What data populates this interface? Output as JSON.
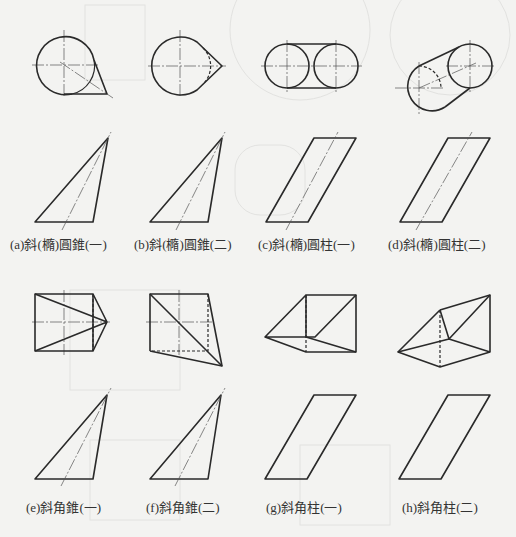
{
  "figure": {
    "panels": [
      {
        "id": "a",
        "caption": "(a)斜(橢)圓錐(一)"
      },
      {
        "id": "b",
        "caption": "(b)斜(橢)圓錐(二)"
      },
      {
        "id": "c",
        "caption": "(c)斜(橢)圓柱(一)"
      },
      {
        "id": "d",
        "caption": "(d)斜(橢)圓柱(二)"
      },
      {
        "id": "e",
        "caption": "(e)斜角錐(一)"
      },
      {
        "id": "f",
        "caption": "(f)斜角錐(二)"
      },
      {
        "id": "g",
        "caption": "(g)斜角柱(一)"
      },
      {
        "id": "h",
        "caption": "(h)斜角柱(二)"
      }
    ],
    "colors": {
      "background": "#f3f3f1",
      "line": "#2a2a2a",
      "caption": "#333333"
    }
  }
}
